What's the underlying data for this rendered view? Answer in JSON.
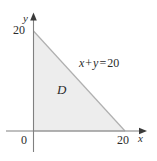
{
  "figure": {
    "name": "triangular-region-D-diagram",
    "background_color": "#ffffff",
    "axis_color": "#6e6e6e",
    "region_fill_color": "#ededed",
    "region_stroke_color": "#b6b6b6",
    "text_color": "#2b2b2b"
  },
  "axes": {
    "x": {
      "label": "x",
      "origin_label": "0",
      "ticks": [
        {
          "value": 20,
          "label": "20"
        }
      ],
      "arrow": true
    },
    "y": {
      "label": "y",
      "ticks": [
        {
          "value": 20,
          "label": "20"
        }
      ],
      "arrow": true
    }
  },
  "region": {
    "label": "D",
    "type": "triangle",
    "vertices": [
      {
        "x": 0,
        "y": 0
      },
      {
        "x": 20,
        "y": 0
      },
      {
        "x": 0,
        "y": 20
      }
    ]
  },
  "line": {
    "equation_lhs_x": "x",
    "equation_op_plus": "+",
    "equation_lhs_y": "y",
    "equation_op_equals": "=",
    "equation_rhs": "20",
    "equation_full": "x + y = 20",
    "from": {
      "x": 0,
      "y": 20
    },
    "to": {
      "x": 20,
      "y": 0
    }
  }
}
